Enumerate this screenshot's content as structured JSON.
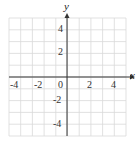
{
  "chart_data": {
    "type": "scatter",
    "title": "",
    "xlabel": "x",
    "ylabel": "y",
    "xlim": [
      -5,
      5
    ],
    "ylim": [
      -5,
      5
    ],
    "grid": true,
    "x_ticks": [
      "-4",
      "-2",
      "0",
      "2",
      "4"
    ],
    "y_ticks": [
      "4",
      "2",
      "-2",
      "-4"
    ],
    "series": []
  },
  "colors": {
    "grid": "#d9d9d9",
    "axis": "#333333"
  }
}
